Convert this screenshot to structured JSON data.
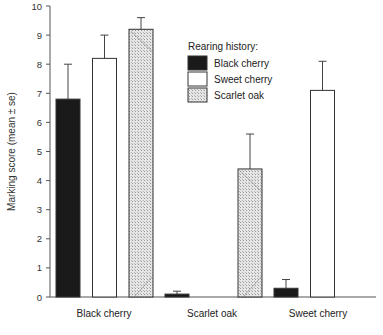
{
  "chart_data": {
    "type": "bar",
    "title": "",
    "xlabel": "",
    "ylabel": "Marking score (mean ± se)",
    "ylim": [
      0,
      10
    ],
    "yticks": [
      0,
      1,
      2,
      3,
      4,
      5,
      6,
      7,
      8,
      9,
      10
    ],
    "grid": false,
    "legend_title": "Rearing history:",
    "legend_position": "upper right",
    "categories": [
      "Black cherry",
      "Scarlet oak",
      "Sweet cherry"
    ],
    "series": [
      {
        "name": "Black cherry",
        "style": "solid-black",
        "values": [
          6.8,
          0.1,
          0.3
        ],
        "error_upper": [
          8.0,
          0.2,
          0.6
        ]
      },
      {
        "name": "Sweet cherry",
        "style": "white",
        "values": [
          8.2,
          null,
          7.1
        ],
        "error_upper": [
          9.0,
          null,
          8.1
        ]
      },
      {
        "name": "Scarlet oak",
        "style": "hatched",
        "values": [
          9.2,
          4.4,
          null
        ],
        "error_upper": [
          9.6,
          5.6,
          null
        ]
      }
    ]
  },
  "colors": {
    "black": "#1a1a1a",
    "white": "#ffffff",
    "hatch": "#c8c8c8",
    "axis": "#555555"
  }
}
